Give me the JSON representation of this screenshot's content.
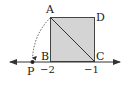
{
  "diagram": {
    "type": "number-line-square",
    "points": {
      "A": "A",
      "B": "B",
      "C": "C",
      "D": "D",
      "P": "P"
    },
    "ticks": {
      "B_value": "−2",
      "C_value": "−1"
    },
    "colors": {
      "square_fill": "#d4d4d4",
      "stroke": "#333333",
      "background": "#ffffff"
    }
  }
}
